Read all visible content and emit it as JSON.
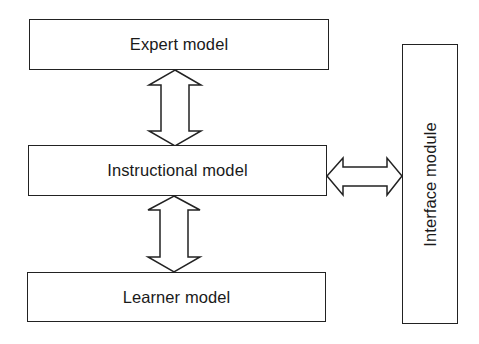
{
  "diagram": {
    "title": "",
    "nodes": [
      {
        "id": "expert",
        "label": "Expert model"
      },
      {
        "id": "instructional",
        "label": "Instructional model"
      },
      {
        "id": "learner",
        "label": "Learner model"
      },
      {
        "id": "interface",
        "label": "Interface module"
      }
    ],
    "edges": [
      {
        "from": "expert",
        "to": "instructional",
        "type": "bidirectional-block-arrow"
      },
      {
        "from": "instructional",
        "to": "learner",
        "type": "bidirectional-block-arrow"
      },
      {
        "from": "instructional",
        "to": "interface",
        "type": "bidirectional-block-arrow"
      }
    ]
  },
  "labels": {
    "expert": "Expert model",
    "instructional": "Instructional model",
    "learner": "Learner model",
    "interface": "Interface module"
  },
  "colors": {
    "stroke": "#222222",
    "fill": "#ffffff",
    "text": "#1a1a1a"
  }
}
